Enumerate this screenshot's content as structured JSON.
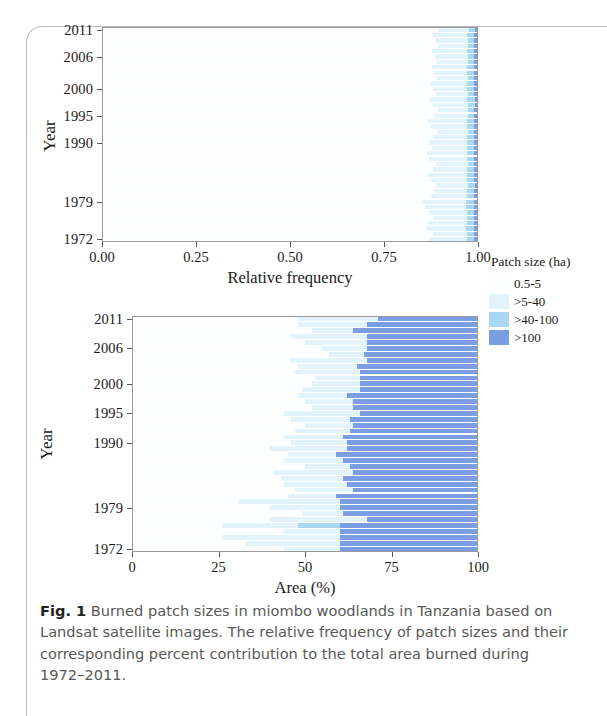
{
  "figure": {
    "caption_label": "Fig. 1",
    "caption_text": "Burned patch sizes in miombo woodlands in Tanzania based on Landsat satellite images. The relative frequency of patch sizes and their corresponding percent contribution to the total area burned during 1972–2011."
  },
  "legend": {
    "title": "Patch size (ha)",
    "items": [
      {
        "label": "0.5-5",
        "color": "#fdfeff"
      },
      {
        "label": ">5-40",
        "color": "#e2f3fb"
      },
      {
        "label": ">40-100",
        "color": "#a9d9f2"
      },
      {
        "label": ">100",
        "color": "#7b9ee2"
      }
    ]
  },
  "chart_data": [
    {
      "type": "bar",
      "orientation": "horizontal",
      "stacked": true,
      "normalized": true,
      "title": "",
      "xlabel": "Relative frequency",
      "ylabel": "Year",
      "xlim": [
        0,
        1
      ],
      "xticks": [
        "0.00",
        "0.25",
        "0.50",
        "0.75",
        "1.00"
      ],
      "xtick_values": [
        0,
        0.25,
        0.5,
        0.75,
        1
      ],
      "yticks": [
        "2011",
        "2006",
        "2000",
        "1995",
        "1990",
        "1979",
        "1972"
      ],
      "ytick_values": [
        2011,
        2006,
        2000,
        1995,
        1990,
        1979,
        1972
      ],
      "grid": false,
      "legend_position": "right",
      "categories": [
        "0.5-5",
        ">5-40",
        ">40-100",
        ">100"
      ],
      "years": [
        1972,
        1973,
        1974,
        1975,
        1976,
        1977,
        1978,
        1979,
        1980,
        1981,
        1982,
        1983,
        1984,
        1985,
        1986,
        1987,
        1988,
        1989,
        1990,
        1991,
        1992,
        1993,
        1994,
        1995,
        1996,
        1997,
        1998,
        1999,
        2000,
        2001,
        2002,
        2003,
        2004,
        2005,
        2006,
        2007,
        2008,
        2009,
        2010,
        2011
      ],
      "series": [
        {
          "name": "0.5-5",
          "values": [
            0.872,
            0.88,
            0.861,
            0.868,
            0.884,
            0.87,
            0.858,
            0.852,
            0.876,
            0.883,
            0.889,
            0.874,
            0.866,
            0.879,
            0.887,
            0.871,
            0.864,
            0.877,
            0.869,
            0.882,
            0.891,
            0.875,
            0.868,
            0.886,
            0.893,
            0.879,
            0.872,
            0.888,
            0.881,
            0.874,
            0.89,
            0.883,
            0.877,
            0.892,
            0.885,
            0.878,
            0.894,
            0.887,
            0.88,
            0.896
          ]
        },
        {
          "name": ">5-40",
          "values": [
            0.098,
            0.092,
            0.108,
            0.102,
            0.088,
            0.1,
            0.11,
            0.115,
            0.094,
            0.089,
            0.085,
            0.097,
            0.104,
            0.092,
            0.086,
            0.099,
            0.106,
            0.094,
            0.101,
            0.09,
            0.082,
            0.096,
            0.103,
            0.087,
            0.081,
            0.094,
            0.1,
            0.085,
            0.091,
            0.098,
            0.083,
            0.089,
            0.095,
            0.081,
            0.088,
            0.094,
            0.08,
            0.086,
            0.092,
            0.079
          ]
        },
        {
          "name": ">40-100",
          "values": [
            0.02,
            0.018,
            0.021,
            0.02,
            0.018,
            0.019,
            0.022,
            0.022,
            0.019,
            0.018,
            0.017,
            0.019,
            0.02,
            0.018,
            0.017,
            0.019,
            0.02,
            0.019,
            0.019,
            0.018,
            0.017,
            0.019,
            0.019,
            0.017,
            0.016,
            0.018,
            0.019,
            0.017,
            0.018,
            0.018,
            0.017,
            0.018,
            0.018,
            0.017,
            0.017,
            0.018,
            0.016,
            0.017,
            0.018,
            0.016
          ]
        },
        {
          "name": ">100",
          "values": [
            0.01,
            0.01,
            0.01,
            0.01,
            0.01,
            0.011,
            0.01,
            0.011,
            0.011,
            0.01,
            0.009,
            0.01,
            0.01,
            0.011,
            0.01,
            0.011,
            0.01,
            0.01,
            0.011,
            0.01,
            0.01,
            0.01,
            0.01,
            0.01,
            0.01,
            0.009,
            0.009,
            0.01,
            0.01,
            0.01,
            0.01,
            0.01,
            0.01,
            0.01,
            0.01,
            0.01,
            0.01,
            0.01,
            0.01,
            0.009
          ]
        }
      ]
    },
    {
      "type": "bar",
      "orientation": "horizontal",
      "stacked": true,
      "normalized": true,
      "title": "",
      "xlabel": "Area (%)",
      "ylabel": "Year",
      "xlim": [
        0,
        100
      ],
      "xticks": [
        "0",
        "25",
        "50",
        "75",
        "100"
      ],
      "xtick_values": [
        0,
        25,
        50,
        75,
        100
      ],
      "yticks": [
        "2011",
        "2006",
        "2000",
        "1995",
        "1990",
        "1979",
        "1972"
      ],
      "ytick_values": [
        2011,
        2006,
        2000,
        1995,
        1990,
        1979,
        1972
      ],
      "grid": false,
      "legend_position": "right",
      "categories": [
        "0.5-5",
        ">5-40",
        ">40-100",
        ">100"
      ],
      "years": [
        1972,
        1973,
        1974,
        1975,
        1976,
        1977,
        1978,
        1979,
        1980,
        1981,
        1982,
        1983,
        1984,
        1985,
        1986,
        1987,
        1988,
        1989,
        1990,
        1991,
        1992,
        1993,
        1994,
        1995,
        1996,
        1997,
        1998,
        1999,
        2000,
        2001,
        2002,
        2003,
        2004,
        2005,
        2006,
        2007,
        2008,
        2009,
        2010,
        2011
      ],
      "series": [
        {
          "name": "0.5-5",
          "values": [
            44,
            33,
            26,
            44,
            26,
            40,
            49,
            40,
            31,
            45,
            47,
            44,
            43,
            41,
            50,
            44,
            45,
            40,
            46,
            44,
            47,
            50,
            46,
            44,
            52,
            50,
            48,
            49,
            52,
            53,
            47,
            48,
            46,
            57,
            55,
            50,
            46,
            52,
            48,
            48
          ]
        },
        {
          "name": ">5-40",
          "values": [
            16,
            27,
            34,
            16,
            22,
            28,
            12,
            20,
            29,
            14,
            17,
            18,
            18,
            23,
            13,
            17,
            14,
            22,
            16,
            17,
            16,
            14,
            17,
            22,
            12,
            14,
            14,
            17,
            14,
            13,
            19,
            17,
            22,
            10,
            13,
            18,
            22,
            12,
            20,
            23
          ]
        },
        {
          "name": ">40-100",
          "values": [
            0,
            0,
            0,
            0,
            12,
            0,
            0,
            0,
            0,
            0,
            0,
            0,
            0,
            0,
            0,
            0,
            0,
            0,
            0,
            0,
            0,
            0,
            0,
            0,
            0,
            0,
            0,
            0,
            0,
            0,
            0,
            0,
            0,
            0,
            0,
            0,
            0,
            0,
            0,
            0
          ]
        },
        {
          "name": ">100",
          "values": [
            40,
            40,
            40,
            40,
            40,
            32,
            39,
            40,
            40,
            41,
            36,
            38,
            39,
            36,
            37,
            39,
            41,
            38,
            38,
            39,
            37,
            36,
            37,
            34,
            36,
            36,
            38,
            34,
            34,
            34,
            34,
            35,
            32,
            33,
            32,
            32,
            32,
            36,
            32,
            29
          ]
        }
      ]
    }
  ]
}
